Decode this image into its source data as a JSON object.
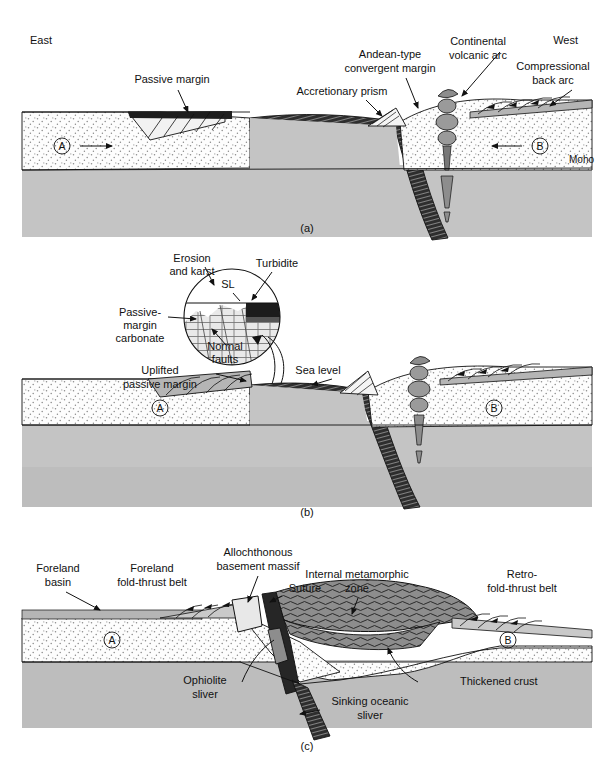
{
  "figure": {
    "type": "geologic-cross-section-series",
    "orientation": {
      "left": "East",
      "right": "West"
    },
    "plates": {
      "left_label": "A",
      "right_label": "B"
    }
  },
  "colors": {
    "crust_stipple": "#fdfdfd",
    "mantle_gray": "#c4c4c4",
    "lower_gray": "#bdbdbd",
    "oceanic_dark": "#2b2b2b",
    "metamorphic_gray": "#8d8d8d",
    "sediment_gray": "#b5b5b5",
    "outline": "#111111",
    "background": "#ffffff"
  },
  "panels": [
    {
      "id": "a",
      "caption": "(a)",
      "labels": [
        {
          "key": "east",
          "text": "East",
          "x": 30,
          "y": 44
        },
        {
          "key": "west",
          "text": "West",
          "x": 578,
          "y": 44
        },
        {
          "key": "passive_margin",
          "text": "Passive margin",
          "x": 172,
          "y": 83
        },
        {
          "key": "accretionary",
          "text": "Accretionary prism",
          "x": 342,
          "y": 95
        },
        {
          "key": "andean_1",
          "text": "Andean-type",
          "x": 390,
          "y": 58
        },
        {
          "key": "andean_2",
          "text": "convergent margin",
          "x": 390,
          "y": 72
        },
        {
          "key": "volcarc_1",
          "text": "Continental",
          "x": 478,
          "y": 45
        },
        {
          "key": "volcarc_2",
          "text": "volcanic arc",
          "x": 478,
          "y": 59
        },
        {
          "key": "backarc_1",
          "text": "Compressional",
          "x": 553,
          "y": 70
        },
        {
          "key": "backarc_2",
          "text": "back arc",
          "x": 553,
          "y": 84
        },
        {
          "key": "moho",
          "text": "Moho",
          "x": 594,
          "y": 163
        }
      ],
      "plate_a": "A",
      "plate_b": "B"
    },
    {
      "id": "b",
      "caption": "(b)",
      "inset": {
        "shape": "circle",
        "labels": [
          {
            "key": "erosion_1",
            "text": "Erosion",
            "x": 192,
            "y": 262
          },
          {
            "key": "erosion_2",
            "text": "and karst",
            "x": 192,
            "y": 275
          },
          {
            "key": "turbidite",
            "text": "Turbidite",
            "x": 277,
            "y": 267
          },
          {
            "key": "sl",
            "text": "SL",
            "x": 228,
            "y": 288
          },
          {
            "key": "pm_carb_1",
            "text": "Passive-",
            "x": 140,
            "y": 316
          },
          {
            "key": "pm_carb_2",
            "text": "margin",
            "x": 140,
            "y": 329
          },
          {
            "key": "pm_carb_3",
            "text": "carbonate",
            "x": 140,
            "y": 342
          },
          {
            "key": "normal_1",
            "text": "Normal",
            "x": 225,
            "y": 350
          },
          {
            "key": "normal_2",
            "text": "faults",
            "x": 225,
            "y": 363
          }
        ]
      },
      "labels": [
        {
          "key": "uplifted_1",
          "text": "Uplifted",
          "x": 160,
          "y": 374
        },
        {
          "key": "uplifted_2",
          "text": "passive margin",
          "x": 160,
          "y": 388
        },
        {
          "key": "sea_level",
          "text": "Sea level",
          "x": 318,
          "y": 374
        }
      ],
      "plate_a": "A",
      "plate_b": "B"
    },
    {
      "id": "c",
      "caption": "(c)",
      "labels": [
        {
          "key": "foreland_basin_1",
          "text": "Foreland",
          "x": 58,
          "y": 572
        },
        {
          "key": "foreland_basin_2",
          "text": "basin",
          "x": 58,
          "y": 586
        },
        {
          "key": "fold_thrust_1",
          "text": "Foreland",
          "x": 152,
          "y": 572
        },
        {
          "key": "fold_thrust_2",
          "text": "fold-thrust belt",
          "x": 152,
          "y": 586
        },
        {
          "key": "allochth_1",
          "text": "Allochthonous",
          "x": 258,
          "y": 556
        },
        {
          "key": "allochth_2",
          "text": "basement massif",
          "x": 258,
          "y": 570
        },
        {
          "key": "suture",
          "text": "Suture",
          "x": 272,
          "y": 588
        },
        {
          "key": "internal_1",
          "text": "Internal metamorphic",
          "x": 357,
          "y": 578
        },
        {
          "key": "internal_2",
          "text": "zone",
          "x": 357,
          "y": 592
        },
        {
          "key": "retro_1",
          "text": "Retro-",
          "x": 522,
          "y": 578
        },
        {
          "key": "retro_2",
          "text": "fold-thrust belt",
          "x": 522,
          "y": 592
        },
        {
          "key": "ophiolite_1",
          "text": "Ophiolite",
          "x": 205,
          "y": 684
        },
        {
          "key": "ophiolite_2",
          "text": "sliver",
          "x": 205,
          "y": 698
        },
        {
          "key": "sinking_1",
          "text": "Sinking oceanic",
          "x": 360,
          "y": 705
        },
        {
          "key": "sinking_2",
          "text": "sliver",
          "x": 360,
          "y": 719
        },
        {
          "key": "thick_crust",
          "text": "Thickened crust",
          "x": 460,
          "y": 685
        }
      ],
      "plate_a": "A",
      "plate_b": "B"
    }
  ]
}
